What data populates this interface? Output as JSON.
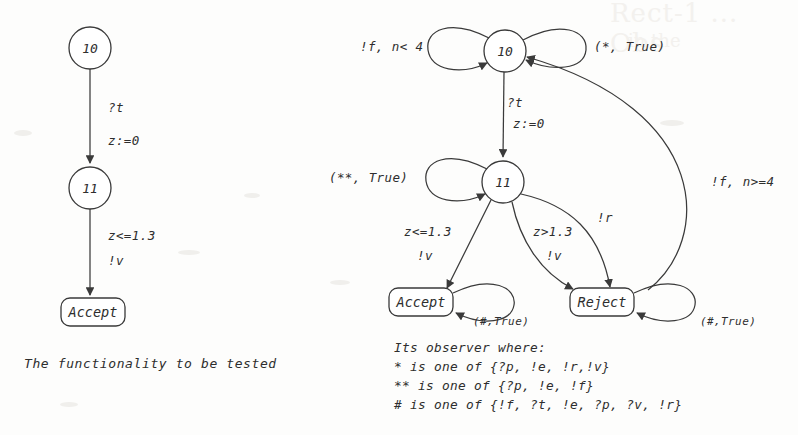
{
  "figure": {
    "caption_left": "The functionality to be tested",
    "ghost_top_right": "Rect-1 ... Obs",
    "ghost_top_right_sub": "in the"
  },
  "left_diagram": {
    "name": "functionality-under-test",
    "nodes": [
      {
        "id": "n10",
        "label": "10",
        "shape": "circle"
      },
      {
        "id": "n11",
        "label": "11",
        "shape": "circle"
      },
      {
        "id": "accept",
        "label": "Accept",
        "shape": "rounded-box"
      }
    ],
    "edge_labels": {
      "t10_11_event": "?t",
      "t10_11_action": "z:=0",
      "t11_accept_guard": "z<=1.3",
      "t11_accept_action": "!v"
    }
  },
  "right_diagram": {
    "name": "observer",
    "nodes": [
      {
        "id": "n10",
        "label": "10",
        "shape": "circle"
      },
      {
        "id": "n11",
        "label": "11",
        "shape": "circle"
      },
      {
        "id": "accept",
        "label": "Accept",
        "shape": "rounded-box"
      },
      {
        "id": "reject",
        "label": "Reject",
        "shape": "rounded-box"
      }
    ],
    "edge_labels": {
      "loop10_left": "!f, n< 4",
      "loop10_right": "(*, True)",
      "t10_11_event": "?t",
      "t10_11_action": "z:=0",
      "loop11_left": "(**, True)",
      "t11_accept_guard": "z<=1.3",
      "t11_accept_action": "!v",
      "t11_reject_guard": "z>1.3",
      "t11_reject_action": "!v",
      "t10_reject": "!r",
      "t_reject_10": "!f, n>=4",
      "loop_accept": "(#,True)",
      "loop_reject": "(#,True)"
    }
  },
  "legend": {
    "title": "Its observer where:",
    "lines": [
      "* is one of {?p, !e, !r,!v}",
      "** is one of {?p, !e, !f}",
      "# is one of {!f, ?t, !e, ?p, ?v, !r}"
    ]
  }
}
